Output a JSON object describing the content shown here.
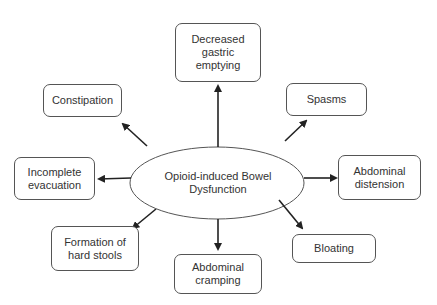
{
  "diagram": {
    "center": {
      "label": "Opioid-induced Bowel\nDysfunction"
    },
    "nodes": [
      {
        "id": "decreased-gastric-emptying",
        "label": "Decreased\ngastric\nemptying"
      },
      {
        "id": "constipation",
        "label": "Constipation"
      },
      {
        "id": "spasms",
        "label": "Spasms"
      },
      {
        "id": "incomplete-evacuation",
        "label": "Incomplete\nevacuation"
      },
      {
        "id": "abdominal-distension",
        "label": "Abdominal\ndistension"
      },
      {
        "id": "formation-of-hard-stools",
        "label": "Formation of\nhard stools"
      },
      {
        "id": "bloating",
        "label": "Bloating"
      },
      {
        "id": "abdominal-cramping",
        "label": "Abdominal\ncramping"
      }
    ],
    "colors": {
      "stroke": "#555555",
      "arrow": "#222222",
      "text": "#333333"
    }
  }
}
